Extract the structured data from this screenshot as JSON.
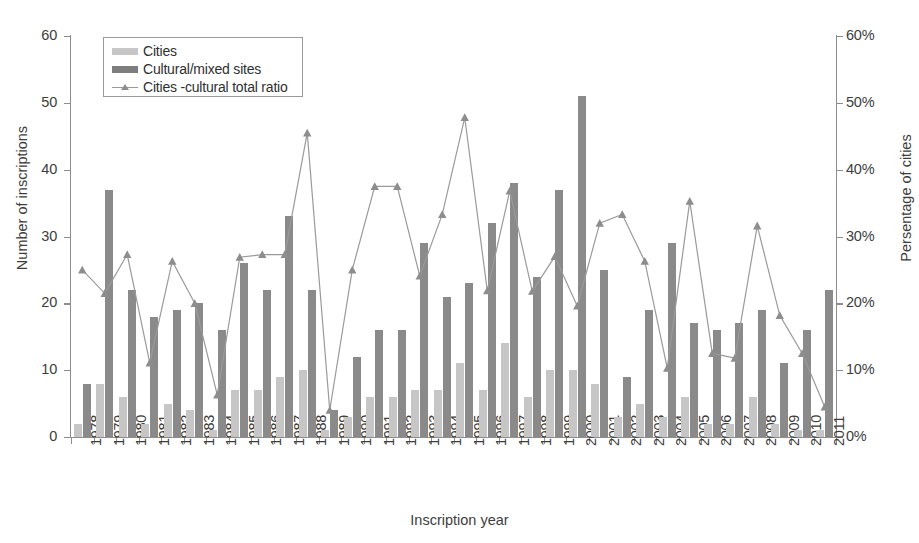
{
  "chart_data": {
    "type": "bar",
    "title": "",
    "xlabel": "Inscription year",
    "ylabel": "Number of inscriptions",
    "ylabel_right": "Persentage of cities",
    "ylim": [
      0,
      60
    ],
    "yticks": [
      0,
      10,
      20,
      30,
      40,
      50,
      60
    ],
    "ylim_right": [
      0,
      60
    ],
    "yticks_right_labels": [
      "0%",
      "10%",
      "20%",
      "30%",
      "40%",
      "50%",
      "60%"
    ],
    "grid": false,
    "legend_position": "top-left",
    "categories": [
      "1978",
      "1979",
      "1980",
      "1981",
      "1982",
      "1983",
      "1984",
      "1985",
      "1986",
      "1987",
      "1988",
      "1989",
      "1990",
      "1991",
      "1992",
      "1993",
      "1994",
      "1995",
      "1996",
      "1997",
      "1998",
      "1999",
      "2000",
      "2001",
      "2002",
      "2003",
      "2004",
      "2005",
      "2006",
      "2007",
      "2008",
      "2009",
      "2010",
      "2011"
    ],
    "series": [
      {
        "name": "Cities",
        "type": "bar",
        "color": "#c6c6c6",
        "axis": "left",
        "values": [
          2,
          8,
          6,
          2,
          5,
          4,
          1,
          7,
          7,
          9,
          10,
          1,
          3,
          6,
          6,
          7,
          7,
          11,
          7,
          14,
          6,
          10,
          10,
          8,
          3,
          5,
          3,
          6,
          2,
          2,
          6,
          2,
          1,
          1
        ]
      },
      {
        "name": "Cultural/mixed sites",
        "type": "bar",
        "color": "#8a8a8a",
        "axis": "left",
        "values": [
          8,
          37,
          22,
          18,
          19,
          20,
          16,
          26,
          22,
          33,
          22,
          4,
          12,
          16,
          16,
          29,
          21,
          23,
          32,
          38,
          24,
          37,
          51,
          25,
          9,
          19,
          29,
          17,
          16,
          17,
          19,
          11,
          16,
          22
        ]
      },
      {
        "name": "Cities -cultural total ratio",
        "type": "line",
        "color": "#9a9a9a",
        "marker": "triangle",
        "axis": "right",
        "values": [
          25.0,
          21.5,
          27.3,
          11.1,
          26.3,
          20.0,
          6.3,
          26.9,
          27.3,
          27.3,
          45.5,
          4.0,
          25.0,
          37.5,
          37.5,
          24.1,
          33.3,
          47.8,
          21.9,
          36.8,
          21.8,
          27.0,
          19.6,
          32.0,
          33.3,
          26.3,
          10.3,
          35.3,
          12.5,
          11.8,
          31.6,
          18.2,
          12.5,
          4.5
        ]
      }
    ]
  },
  "legend": {
    "items": [
      {
        "label": "Cities",
        "marker": "swatch-cities"
      },
      {
        "label": "Cultural/mixed sites",
        "marker": "swatch-cultural"
      },
      {
        "label": "Cities -cultural total ratio",
        "marker": "line-triangle"
      }
    ]
  },
  "colors": {
    "cities_bar": "#c6c6c6",
    "cultural_bar": "#8a8a8a",
    "ratio_line": "#9a9a9a",
    "axis": "#8d8d8d",
    "text": "#3d3d3d",
    "background": "#ffffff"
  }
}
